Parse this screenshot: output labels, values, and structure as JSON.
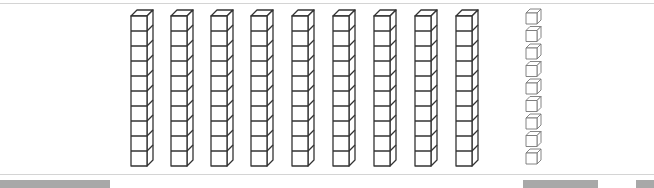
{
  "diagram": {
    "tens_rods": {
      "count": 9,
      "cubes_per_rod": 10,
      "x_positions": [
        131,
        171,
        211,
        251,
        292,
        333,
        374,
        415,
        456
      ],
      "stroke": "#333333"
    },
    "ones_cubes": {
      "count": 9,
      "x": 526,
      "stroke": "#777777"
    },
    "represented_value": 99
  },
  "colors": {
    "background": "#ffffff",
    "divider": "#d4d4d4",
    "scrollbar": "#a8a8a8"
  },
  "bottom_bars": [
    {
      "left": 0,
      "width": 110
    },
    {
      "left": 523,
      "width": 75
    },
    {
      "left": 636,
      "width": 18
    }
  ]
}
